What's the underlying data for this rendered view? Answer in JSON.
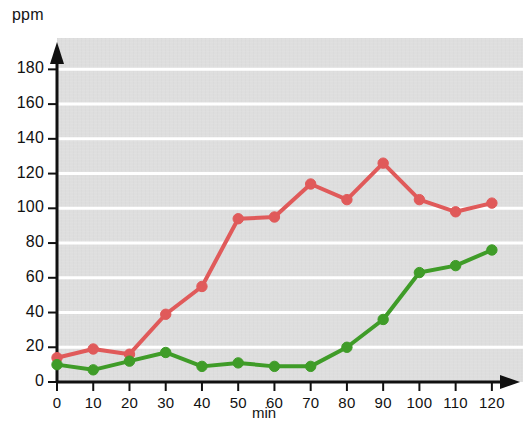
{
  "chart_data": {
    "type": "line",
    "title": "",
    "xlabel": "min",
    "ylabel": "ppm",
    "x": [
      0,
      10,
      20,
      30,
      40,
      50,
      60,
      70,
      80,
      90,
      100,
      110,
      120
    ],
    "xlim": [
      0,
      120
    ],
    "ylim": [
      0,
      190
    ],
    "xticks": [
      "0",
      "10",
      "20",
      "30",
      "40",
      "50",
      "60",
      "70",
      "80",
      "90",
      "100",
      "110",
      "120"
    ],
    "yticks": [
      "0",
      "20",
      "40",
      "60",
      "80",
      "100",
      "120",
      "140",
      "160",
      "180"
    ],
    "grid": "horizontal-white-gridlines",
    "legend": "none",
    "series": [
      {
        "name": "red",
        "color": "#e05a5a",
        "marker": "circle",
        "values": [
          14,
          19,
          16,
          39,
          55,
          94,
          95,
          114,
          105,
          126,
          105,
          98,
          103
        ]
      },
      {
        "name": "green",
        "color": "#3f9c28",
        "marker": "circle",
        "values": [
          10,
          7,
          12,
          17,
          9,
          11,
          9,
          9,
          20,
          36,
          63,
          67,
          76
        ]
      }
    ]
  }
}
